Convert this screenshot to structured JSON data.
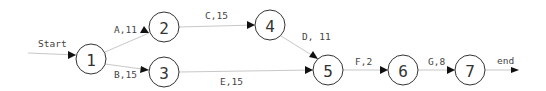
{
  "diagram": {
    "type": "activity-on-node network",
    "nodes": [
      {
        "id": "1",
        "label": "1",
        "cx": 91,
        "cy": 59
      },
      {
        "id": "2",
        "label": "2",
        "cx": 164,
        "cy": 27
      },
      {
        "id": "3",
        "label": "3",
        "cx": 164,
        "cy": 72
      },
      {
        "id": "4",
        "label": "4",
        "cx": 270,
        "cy": 25
      },
      {
        "id": "5",
        "label": "5",
        "cx": 328,
        "cy": 70
      },
      {
        "id": "6",
        "label": "6",
        "cx": 403,
        "cy": 70
      },
      {
        "id": "7",
        "label": "7",
        "cx": 470,
        "cy": 70
      }
    ],
    "edges": [
      {
        "from": "start",
        "to": "1",
        "label": "Start"
      },
      {
        "from": "1",
        "to": "2",
        "label": "A,11",
        "activity": "A",
        "duration": 11
      },
      {
        "from": "1",
        "to": "3",
        "label": "B,15",
        "activity": "B",
        "duration": 15
      },
      {
        "from": "2",
        "to": "4",
        "label": "C,15",
        "activity": "C",
        "duration": 15
      },
      {
        "from": "4",
        "to": "5",
        "label": "D, 11",
        "activity": "D",
        "duration": 11
      },
      {
        "from": "3",
        "to": "5",
        "label": "E,15",
        "activity": "E",
        "duration": 15
      },
      {
        "from": "5",
        "to": "6",
        "label": "F,2",
        "activity": "F",
        "duration": 2
      },
      {
        "from": "6",
        "to": "7",
        "label": "G,8",
        "activity": "G",
        "duration": 8
      },
      {
        "from": "7",
        "to": "end",
        "label": "end"
      }
    ],
    "colors": {
      "edge": "#c8c8c8",
      "node_stroke": "#333333",
      "arrowhead": "#111111",
      "text": "#444444"
    }
  }
}
